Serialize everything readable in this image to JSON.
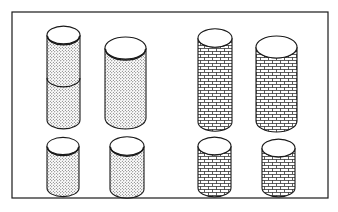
{
  "figure": {
    "width": 338,
    "height": 212,
    "frame": {
      "x": 12,
      "y": 12,
      "w": 316,
      "h": 186
    },
    "colors": {
      "stroke": "#1a1a1a",
      "fill": "#ffffff",
      "dot": "#3a3a3a"
    },
    "cylinders": [
      {
        "id": "dotted-tall-split",
        "texture": "dots",
        "x": 47,
        "w": 33,
        "top": 35,
        "bottom": 120,
        "split": 78
      },
      {
        "id": "dotted-large",
        "texture": "dots",
        "x": 105,
        "w": 41,
        "top": 48,
        "bottom": 118
      },
      {
        "id": "dotted-small-left",
        "texture": "dots",
        "x": 47,
        "w": 32,
        "top": 146,
        "bottom": 188
      },
      {
        "id": "dotted-small-right",
        "texture": "dots",
        "x": 110,
        "w": 34,
        "top": 146,
        "bottom": 189
      },
      {
        "id": "brick-tall",
        "texture": "brick",
        "x": 198,
        "w": 34,
        "top": 38,
        "bottom": 122
      },
      {
        "id": "brick-large",
        "texture": "brick",
        "x": 256,
        "w": 41,
        "top": 47,
        "bottom": 121
      },
      {
        "id": "brick-small-left",
        "texture": "brick",
        "x": 198,
        "w": 33,
        "top": 146,
        "bottom": 188
      },
      {
        "id": "brick-small-right",
        "texture": "brick",
        "x": 262,
        "w": 33,
        "top": 148,
        "bottom": 188
      }
    ]
  }
}
